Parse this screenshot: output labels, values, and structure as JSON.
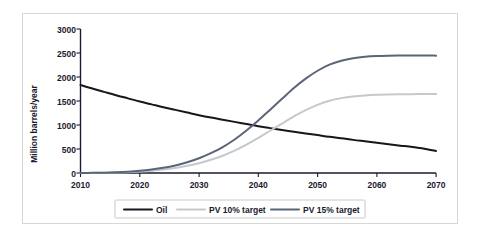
{
  "chart_data": {
    "type": "line",
    "title": "",
    "xlabel": "",
    "ylabel": "Million barrels/year",
    "xlim": [
      2010,
      2070
    ],
    "ylim": [
      0,
      3000
    ],
    "grid": false,
    "legend_position": "bottom",
    "x_ticks": [
      "2010",
      "2020",
      "2030",
      "2040",
      "2050",
      "2060",
      "2070"
    ],
    "y_ticks": [
      "0",
      "500",
      "1000",
      "1500",
      "2000",
      "2500",
      "3000"
    ],
    "x": [
      2010,
      2012,
      2014,
      2016,
      2018,
      2020,
      2022,
      2024,
      2026,
      2028,
      2030,
      2032,
      2034,
      2036,
      2038,
      2040,
      2042,
      2044,
      2046,
      2048,
      2050,
      2052,
      2054,
      2056,
      2058,
      2060,
      2062,
      2064,
      2066,
      2068,
      2070
    ],
    "series": [
      {
        "name": "Oil",
        "color": "#16161e",
        "width": 2.0,
        "values": [
          1835,
          1760,
          1690,
          1620,
          1555,
          1490,
          1430,
          1370,
          1315,
          1260,
          1205,
          1155,
          1110,
          1065,
          1020,
          975,
          935,
          895,
          860,
          825,
          790,
          755,
          725,
          690,
          660,
          630,
          600,
          570,
          540,
          505,
          460
        ]
      },
      {
        "name": "PV 10% target",
        "color": "#c3c9cd",
        "width": 2.0,
        "values": [
          0,
          2,
          5,
          10,
          18,
          30,
          48,
          72,
          105,
          150,
          205,
          275,
          360,
          465,
          590,
          730,
          880,
          1030,
          1180,
          1310,
          1420,
          1505,
          1560,
          1595,
          1615,
          1628,
          1635,
          1640,
          1643,
          1645,
          1645
        ]
      },
      {
        "name": "PV 15% target",
        "color": "#5c6479",
        "width": 2.0,
        "values": [
          0,
          3,
          7,
          15,
          27,
          45,
          72,
          108,
          158,
          225,
          308,
          412,
          540,
          698,
          885,
          1095,
          1320,
          1545,
          1770,
          1965,
          2130,
          2258,
          2340,
          2392,
          2422,
          2438,
          2445,
          2448,
          2450,
          2450,
          2445
        ]
      }
    ]
  },
  "legend": {
    "items": [
      {
        "label": "Oil",
        "color": "#16161e"
      },
      {
        "label": "PV 10% target",
        "color": "#c3c9cd"
      },
      {
        "label": "PV 15% target",
        "color": "#5c6479"
      }
    ]
  }
}
